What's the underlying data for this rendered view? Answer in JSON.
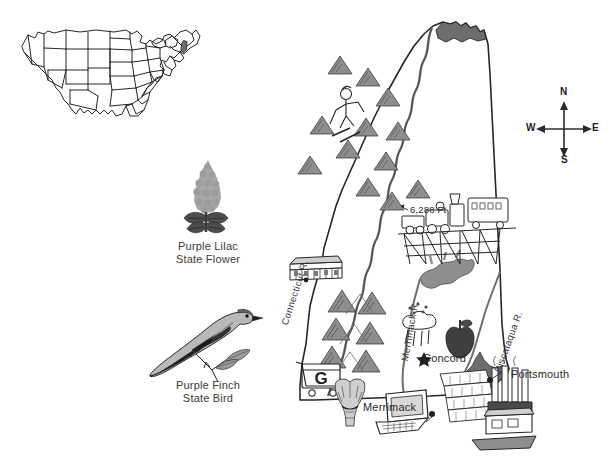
{
  "page": {
    "background_color": "#ffffff",
    "ink_color": "#262626"
  },
  "inset_map": {
    "name": "united-states-locator-map",
    "description": "Outline map of the contiguous United States with New Hampshire shaded",
    "highlighted_state": "New Hampshire",
    "highlight_color": "#6e6e6e",
    "outline_color": "#2b2b2b"
  },
  "emblems": [
    {
      "id": "state-flower",
      "icon": "lilac-icon",
      "line1": "Purple Lilac",
      "line2": "State Flower",
      "flower_color": "#a9a9a9",
      "leaf_color": "#4f4f4f"
    },
    {
      "id": "state-bird",
      "icon": "finch-icon",
      "line1": "Purple Finch",
      "line2": "State Bird",
      "body_color": "#b6b6b6",
      "wing_color": "#2f2f2f"
    }
  ],
  "compass": {
    "name": "compass-rose",
    "north": "N",
    "south": "S",
    "east": "E",
    "west": "W"
  },
  "state_map": {
    "state_name": "New Hampshire",
    "outline_color": "#262626",
    "water_color": "#6d6d6d",
    "cities": [
      {
        "name": "Concord",
        "marker": "star",
        "note": "state capital"
      },
      {
        "name": "Portsmouth",
        "marker": "dot"
      },
      {
        "name": "Merrimack",
        "marker": "dot"
      }
    ],
    "rivers": [
      {
        "name": "Connecticut R."
      },
      {
        "name": "Merrimack R."
      },
      {
        "name": "Piscataqua R."
      }
    ],
    "annotations": [
      {
        "id": "highest-point",
        "text": "6,288 Ft",
        "note": "Mount Washington elevation"
      }
    ],
    "pictographs": [
      {
        "icon": "mountain-icon",
        "label": "mountains",
        "count": 14
      },
      {
        "icon": "skier-icon",
        "label": "skiing"
      },
      {
        "icon": "steam-train-icon",
        "label": "cog railway / train on trestle"
      },
      {
        "icon": "covered-bridge-icon",
        "label": "covered bridge"
      },
      {
        "icon": "lake-icon",
        "label": "Lake Winnipesaukee"
      },
      {
        "icon": "rain-cloud-icon",
        "label": "rainfall"
      },
      {
        "icon": "apple-icon",
        "label": "apple orchards"
      },
      {
        "icon": "shopping-cart-icon",
        "label": "retail / no sales tax",
        "text": "G"
      },
      {
        "icon": "wheat-sheaf-icon",
        "label": "agriculture"
      },
      {
        "icon": "computer-icon",
        "label": "computers / high tech"
      },
      {
        "icon": "paper-stack-icon",
        "label": "paper & pulp mills"
      },
      {
        "icon": "factory-icon",
        "label": "manufacturing"
      },
      {
        "icon": "boat-icon",
        "label": "shipping / port"
      },
      {
        "icon": "forest-icon",
        "label": "north woods"
      }
    ]
  }
}
